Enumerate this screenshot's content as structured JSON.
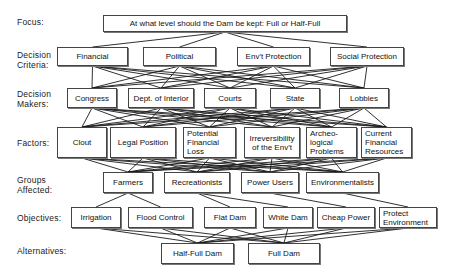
{
  "levels": [
    {
      "key": "focus",
      "label": "Focus:",
      "y": 17
    },
    {
      "key": "criteria",
      "label": "Decision\nCriteria:",
      "y": 50
    },
    {
      "key": "makers",
      "label": "Decision\nMakers:",
      "y": 89
    },
    {
      "key": "factors",
      "label": "Factors:",
      "y": 138
    },
    {
      "key": "groups",
      "label": "Groups\nAffected:",
      "y": 175
    },
    {
      "key": "objectives",
      "label": "Objectives:",
      "y": 213
    },
    {
      "key": "alternatives",
      "label": "Alternatives:",
      "y": 246
    }
  ],
  "nodes": {
    "focus": [
      {
        "text": "At what level should the Dam be kept:  Full or Half-Full",
        "x": 103,
        "y": 15,
        "w": 244,
        "h": 17
      }
    ],
    "criteria": [
      {
        "text": "Financial",
        "x": 57,
        "y": 47,
        "w": 71,
        "h": 19
      },
      {
        "text": "Political",
        "x": 143,
        "y": 47,
        "w": 73,
        "h": 19
      },
      {
        "text": "Env't Protection",
        "x": 237,
        "y": 47,
        "w": 73,
        "h": 19
      },
      {
        "text": "Social Protection",
        "x": 330,
        "y": 47,
        "w": 74,
        "h": 19
      }
    ],
    "makers": [
      {
        "text": "Congress",
        "x": 67,
        "y": 88,
        "w": 50,
        "h": 20
      },
      {
        "text": "Dept. of Interior",
        "x": 128,
        "y": 88,
        "w": 66,
        "h": 20
      },
      {
        "text": "Courts",
        "x": 204,
        "y": 88,
        "w": 52,
        "h": 20
      },
      {
        "text": "State",
        "x": 270,
        "y": 88,
        "w": 50,
        "h": 20
      },
      {
        "text": "Lobbies",
        "x": 339,
        "y": 88,
        "w": 50,
        "h": 20
      }
    ],
    "factors": [
      {
        "text": "Clout",
        "x": 57,
        "y": 127,
        "w": 50,
        "h": 31,
        "align": "center"
      },
      {
        "text": "Legal Position",
        "x": 110,
        "y": 127,
        "w": 66,
        "h": 31,
        "align": "center"
      },
      {
        "text": "Potential\nFinancial\nLoss",
        "x": 183,
        "y": 127,
        "w": 53,
        "h": 31,
        "align": "left"
      },
      {
        "text": "Irreversibility\nof the Env't",
        "x": 244,
        "y": 127,
        "w": 56,
        "h": 31,
        "align": "center"
      },
      {
        "text": "Archeo-\nlogical\nProblems",
        "x": 306,
        "y": 127,
        "w": 51,
        "h": 31,
        "align": "left"
      },
      {
        "text": "Current\nFinancial\nResources",
        "x": 361,
        "y": 127,
        "w": 51,
        "h": 31,
        "align": "left"
      }
    ],
    "groups": [
      {
        "text": "Farmers",
        "x": 103,
        "y": 172,
        "w": 50,
        "h": 21
      },
      {
        "text": "Recreationists",
        "x": 164,
        "y": 172,
        "w": 66,
        "h": 21
      },
      {
        "text": "Power Users",
        "x": 241,
        "y": 172,
        "w": 58,
        "h": 21
      },
      {
        "text": "Environmentalists",
        "x": 306,
        "y": 172,
        "w": 73,
        "h": 21
      }
    ],
    "objectives": [
      {
        "text": "Irrigation",
        "x": 71,
        "y": 207,
        "w": 50,
        "h": 21,
        "align": "center"
      },
      {
        "text": "Flood Control",
        "x": 128,
        "y": 207,
        "w": 65,
        "h": 21,
        "align": "center"
      },
      {
        "text": "Flat Dam",
        "x": 204,
        "y": 207,
        "w": 52,
        "h": 21,
        "align": "center"
      },
      {
        "text": "White Dam",
        "x": 263,
        "y": 207,
        "w": 50,
        "h": 21,
        "align": "center"
      },
      {
        "text": "Cheap Power",
        "x": 317,
        "y": 207,
        "w": 58,
        "h": 21,
        "align": "center"
      },
      {
        "text": "Protect\nEnvironment",
        "x": 379,
        "y": 207,
        "w": 58,
        "h": 21,
        "align": "left"
      }
    ],
    "alternatives": [
      {
        "text": "Half-Full Dam",
        "x": 161,
        "y": 243,
        "w": 73,
        "h": 21
      },
      {
        "text": "Full Dam",
        "x": 248,
        "y": 243,
        "w": 72,
        "h": 21
      }
    ]
  },
  "edges": {
    "focus-criteria": "all",
    "criteria-makers": "all",
    "makers-factors": "all",
    "factors-groups": "all",
    "groups-objectives": [
      [
        0,
        0
      ],
      [
        0,
        1
      ],
      [
        1,
        2
      ],
      [
        1,
        3
      ],
      [
        2,
        4
      ],
      [
        3,
        5
      ]
    ],
    "objectives-alternatives": "all"
  },
  "colors": {
    "line": "#1a1a1a",
    "border": "#444444",
    "background": "#ffffff"
  }
}
